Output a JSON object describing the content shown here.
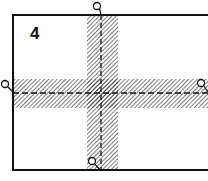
{
  "diagram": {
    "panel_label": "4",
    "frame": {
      "x": 13,
      "y": 15,
      "width": 205,
      "height": 155,
      "stroke": "#111111"
    },
    "vertical_band": {
      "x": 87,
      "width": 31,
      "centerline_x": 101
    },
    "horizontal_band": {
      "y": 79,
      "height": 29,
      "centerline_y": 93
    },
    "markers": [
      {
        "name": "top",
        "cx": 97,
        "cy": 6
      },
      {
        "name": "left",
        "cx": 5,
        "cy": 84
      },
      {
        "name": "right",
        "cx": 201,
        "cy": 83
      },
      {
        "name": "bottom",
        "cx": 92,
        "cy": 161
      }
    ],
    "colors": {
      "line": "#111111",
      "hatch": "#333333",
      "background": "#ffffff"
    }
  }
}
